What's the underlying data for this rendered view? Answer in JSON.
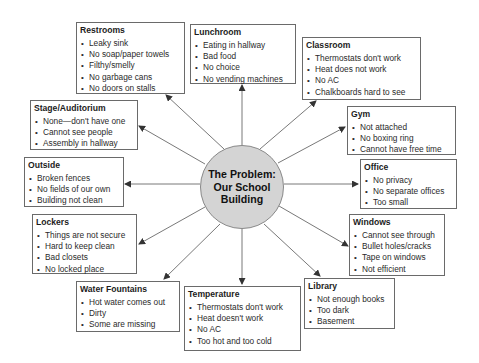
{
  "diagram": {
    "center": {
      "line1": "The Problem:",
      "line2": "Our School",
      "line3": "Building",
      "fill": "#d4d4d4"
    },
    "categories": [
      {
        "id": "restrooms",
        "title": "Restrooms",
        "items": [
          "Leaky sink",
          "No soap/paper towels",
          "Filthy/smelly",
          "No garbage cans",
          "No doors on stalls"
        ]
      },
      {
        "id": "lunchroom",
        "title": "Lunchroom",
        "items": [
          "Eating in hallway",
          "Bad food",
          "No choice",
          "No vending machines"
        ]
      },
      {
        "id": "classroom",
        "title": "Classroom",
        "items": [
          "Thermostats don't work",
          "Heat does not work",
          "No AC",
          "Chalkboards hard to see"
        ]
      },
      {
        "id": "gym",
        "title": "Gym",
        "items": [
          "Not attached",
          "No boxing ring",
          "Cannot have free time"
        ]
      },
      {
        "id": "office",
        "title": "Office",
        "items": [
          "No privacy",
          "No separate offices",
          "Too small"
        ]
      },
      {
        "id": "windows",
        "title": "Windows",
        "items": [
          "Cannot see through",
          "Bullet holes/cracks",
          "Tape on windows",
          "Not efficient"
        ]
      },
      {
        "id": "library",
        "title": "Library",
        "items": [
          "Not enough books",
          "Too dark",
          "Basement"
        ]
      },
      {
        "id": "temperature",
        "title": "Temperature",
        "items": [
          "Thermostats don't work",
          "Heat doesn't work",
          "No AC",
          "Too hot and too cold"
        ]
      },
      {
        "id": "water-fountains",
        "title": "Water Fountains",
        "items": [
          "Hot water comes out",
          "Dirty",
          "Some are missing"
        ]
      },
      {
        "id": "lockers",
        "title": "Lockers",
        "items": [
          "Things are not secure",
          "Hard to keep clean",
          "Bad closets",
          "No locked place"
        ]
      },
      {
        "id": "outside",
        "title": "Outside",
        "items": [
          "Broken fences",
          "No fields of our own",
          "Building not clean"
        ]
      },
      {
        "id": "stage-auditorium",
        "title": "Stage/Auditorium",
        "items": [
          "None—don't have one",
          "Cannot see people",
          "Assembly in hallway"
        ]
      }
    ]
  }
}
